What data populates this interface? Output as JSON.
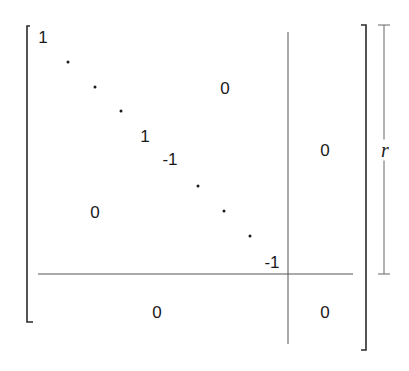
{
  "matrix": {
    "diagonal_top": {
      "first": "1",
      "last": "1"
    },
    "diagonal_bottom": {
      "first": "-1",
      "last": "-1"
    },
    "upper_right_block": "0",
    "lower_left_block": "0",
    "right_block": "0",
    "bottom_left_block": "0",
    "bottom_right_block": "0"
  },
  "dimension_label": "r",
  "colors": {
    "ink": "#1a1a1a",
    "line": "#555555"
  }
}
